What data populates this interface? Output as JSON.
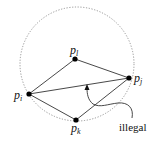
{
  "diagram": {
    "title": "",
    "circle": {
      "cx": 77,
      "cy": 63,
      "r": 57,
      "style": "dotted",
      "color": "#888888"
    },
    "points": [
      {
        "id": "pl",
        "base": "p",
        "sub": "l",
        "x": 75,
        "y": 59
      },
      {
        "id": "pj",
        "base": "p",
        "sub": "j",
        "x": 129,
        "y": 78
      },
      {
        "id": "pi",
        "base": "p",
        "sub": "i",
        "x": 29,
        "y": 94
      },
      {
        "id": "pk",
        "base": "p",
        "sub": "k",
        "x": 76,
        "y": 120
      }
    ],
    "edges": [
      [
        "pi",
        "pl"
      ],
      [
        "pl",
        "pj"
      ],
      [
        "pi",
        "pj"
      ],
      [
        "pi",
        "pk"
      ],
      [
        "pk",
        "pj"
      ]
    ],
    "annotation": {
      "label": "illegal",
      "target_edge": [
        "pi",
        "pj"
      ]
    },
    "labels": {
      "pl_base": "p",
      "pl_sub": "l",
      "pj_base": "p",
      "pj_sub": "j",
      "pi_base": "p",
      "pi_sub": "i",
      "pk_base": "p",
      "pk_sub": "k",
      "illegal": "illegal"
    }
  }
}
